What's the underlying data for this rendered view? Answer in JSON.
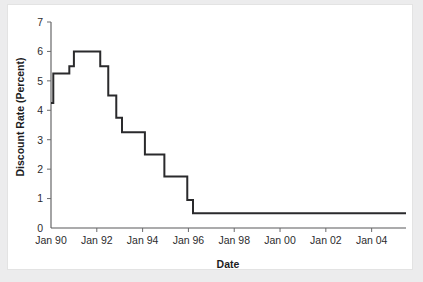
{
  "chart_data": {
    "type": "line",
    "title": "",
    "xlabel": "Date",
    "ylabel": "Discount Rate (Percent)",
    "xlim": [
      "Jan 90",
      "Jul 05"
    ],
    "ylim": [
      0,
      7
    ],
    "grid": false,
    "legend": null,
    "line_style": "step",
    "line_color": "#2a2a2c",
    "y_ticks": [
      0,
      1,
      2,
      3,
      4,
      5,
      6,
      7
    ],
    "y_tick_labels": [
      "0",
      "1",
      "2",
      "3",
      "4",
      "5",
      "6",
      "7"
    ],
    "x_ticks": [
      "Jan 90",
      "Jan 92",
      "Jan 94",
      "Jan 96",
      "Jan 98",
      "Jan 00",
      "Jan 02",
      "Jan 04"
    ],
    "x_tick_labels": [
      "Jan 90",
      "Jan 92",
      "Jan 94",
      "Jan 96",
      "Jan 98",
      "Jan 00",
      "Jan 02",
      "Jan 04"
    ],
    "x_tick_years": [
      1990,
      1992,
      1994,
      1996,
      1998,
      2000,
      2002,
      2004
    ],
    "x_range_years": [
      1990.0,
      2005.5
    ],
    "series": [
      {
        "name": "Discount Rate",
        "points": [
          {
            "date": "Jan 90",
            "x": 1990.0,
            "y": 4.25
          },
          {
            "date": "Feb 90",
            "x": 1990.1,
            "y": 5.25
          },
          {
            "date": "Jan 91",
            "x": 1990.8,
            "y": 5.5
          },
          {
            "date": "May 91",
            "x": 1991.0,
            "y": 6.0
          },
          {
            "date": "Jan 92",
            "x": 1992.0,
            "y": 6.0
          },
          {
            "date": "Mar 92",
            "x": 1992.15,
            "y": 5.5
          },
          {
            "date": "Jul 92",
            "x": 1992.5,
            "y": 4.5
          },
          {
            "date": "Nov 92",
            "x": 1992.85,
            "y": 3.75
          },
          {
            "date": "Feb 93",
            "x": 1993.1,
            "y": 3.25
          },
          {
            "date": "Jan 94",
            "x": 1993.95,
            "y": 3.25
          },
          {
            "date": "Mar 94",
            "x": 1994.1,
            "y": 2.5
          },
          {
            "date": "Nov 94",
            "x": 1994.85,
            "y": 2.5
          },
          {
            "date": "Jan 95",
            "x": 1994.95,
            "y": 1.75
          },
          {
            "date": "Jan 96",
            "x": 1995.85,
            "y": 1.75
          },
          {
            "date": "Mar 96",
            "x": 1995.95,
            "y": 0.95
          },
          {
            "date": "Jul 96",
            "x": 1996.2,
            "y": 0.5
          },
          {
            "date": "Jul 05",
            "x": 2005.5,
            "y": 0.5
          }
        ]
      }
    ],
    "annotations": []
  },
  "axis": {
    "y_title": "Discount Rate (Percent)",
    "x_title": "Date"
  }
}
